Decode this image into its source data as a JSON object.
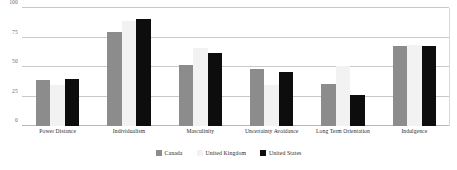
{
  "chart_data": {
    "type": "bar",
    "title": "",
    "subtitle": "",
    "xlabel": "",
    "ylabel": "",
    "ylim": [
      0,
      100
    ],
    "yticks": [
      0,
      25,
      50,
      75,
      100
    ],
    "ytick_labels": [
      "0",
      "25",
      "50",
      "75",
      "100"
    ],
    "grid": true,
    "grid_axis": "y",
    "legend_position": "bottom-center",
    "categories": [
      "Power Distance",
      "Individualism",
      "Masculinity",
      "Uncertainty Avoidance",
      "Long Term Orientation",
      "Indulgence"
    ],
    "series": [
      {
        "name": "Canada",
        "color": "#8c8c8c",
        "values": [
          39,
          80,
          52,
          48,
          36,
          68
        ]
      },
      {
        "name": "United Kingdom",
        "color": "#f2f2f2",
        "values": [
          35,
          89,
          66,
          35,
          51,
          69
        ]
      },
      {
        "name": "United States",
        "color": "#0d0d0d",
        "values": [
          40,
          91,
          62,
          46,
          26,
          68
        ]
      }
    ]
  },
  "legend": {
    "entries": [
      {
        "label": "Canada",
        "color": "#8c8c8c"
      },
      {
        "label": "United Kingdom",
        "color": "#f2f2f2"
      },
      {
        "label": "United States",
        "color": "#0d0d0d"
      }
    ]
  },
  "axis": {
    "y_tick_labels": [
      "100",
      "75",
      "50",
      "25",
      "0"
    ]
  }
}
